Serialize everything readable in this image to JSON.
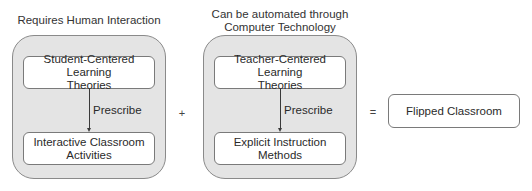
{
  "diagram": {
    "left_group": {
      "caption": "Requires Human Interaction",
      "top_node": {
        "line1": "Student-Centered Learning",
        "line2": "Theories"
      },
      "edge_label": "Prescribe",
      "bottom_node": {
        "line1": "Interactive Classroom",
        "line2": "Activities"
      }
    },
    "plus_operator": "+",
    "right_group": {
      "caption_line1": "Can be automated through",
      "caption_line2": "Computer Technology",
      "top_node": {
        "line1": "Teacher-Centered Learning",
        "line2": "Theories"
      },
      "edge_label": "Prescribe",
      "bottom_node": {
        "line1": "Explicit Instruction",
        "line2": "Methods"
      }
    },
    "equals_operator": "=",
    "result_node": {
      "label": "Flipped Classroom"
    },
    "colors": {
      "group_fill": "#e4e4e4",
      "group_border": "#8a8a8a",
      "node_fill": "#ffffff",
      "node_border": "#7a7a7a",
      "text": "#2a2a2a",
      "connector": "#3a3a3a"
    }
  }
}
